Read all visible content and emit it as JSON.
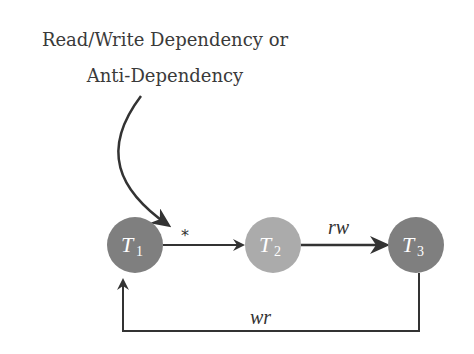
{
  "annotation": {
    "line1": "Read/Write Dependency or",
    "line2": "Anti-Dependency"
  },
  "nodes": [
    {
      "id": "T1",
      "letter": "T",
      "sub": "1",
      "color": "#7f7f7f"
    },
    {
      "id": "T2",
      "letter": "T",
      "sub": "2",
      "color": "#ababab"
    },
    {
      "id": "T3",
      "letter": "T",
      "sub": "3",
      "color": "#7f7f7f"
    }
  ],
  "edges": [
    {
      "from": "T1",
      "to": "T2",
      "label": "*"
    },
    {
      "from": "T2",
      "to": "T3",
      "label": "rw"
    },
    {
      "from": "T3",
      "to": "T1",
      "label": "wr"
    }
  ],
  "colors": {
    "line": "#333333",
    "text": "#3a3a3a"
  }
}
